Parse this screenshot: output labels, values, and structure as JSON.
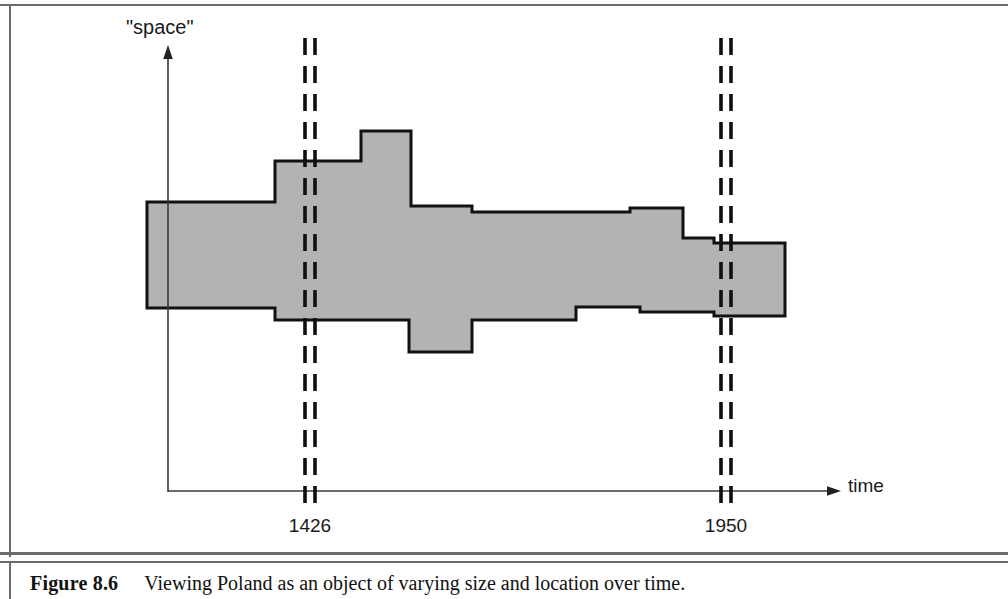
{
  "figure": {
    "caption_number": "Figure 8.6",
    "caption_text": "Viewing Poland as an object of varying size and location over time."
  },
  "axes": {
    "y_label": "\"space\"",
    "x_label": "time"
  },
  "chart_data": {
    "type": "area",
    "title": "Viewing Poland as an object of varying size and location over time.",
    "xlabel": "time",
    "ylabel": "\"space\"",
    "grid": false,
    "legend": null,
    "subject": "Poland",
    "annotations": [
      {
        "label": "1426",
        "type": "vertical-double-dashed-line",
        "x_px": 305
      },
      {
        "label": "1950",
        "type": "vertical-double-dashed-line",
        "x_px": 721
      }
    ],
    "tick_labels": [
      "1426",
      "1950"
    ],
    "region_fill": "#b3b3b3",
    "region_outline": "#111111",
    "region_vertices_px": [
      [
        147,
        202
      ],
      [
        275,
        202
      ],
      [
        275,
        161
      ],
      [
        361,
        161
      ],
      [
        361,
        131
      ],
      [
        411,
        131
      ],
      [
        411,
        206
      ],
      [
        472,
        206
      ],
      [
        472,
        212
      ],
      [
        630,
        212
      ],
      [
        630,
        208
      ],
      [
        683,
        208
      ],
      [
        683,
        238
      ],
      [
        714,
        238
      ],
      [
        714,
        243
      ],
      [
        785,
        243
      ],
      [
        785,
        316
      ],
      [
        714,
        316
      ],
      [
        714,
        312
      ],
      [
        640,
        312
      ],
      [
        640,
        307
      ],
      [
        576,
        307
      ],
      [
        576,
        320
      ],
      [
        472,
        320
      ],
      [
        472,
        352
      ],
      [
        409,
        352
      ],
      [
        409,
        320
      ],
      [
        275,
        320
      ],
      [
        275,
        308
      ],
      [
        147,
        308
      ]
    ]
  }
}
